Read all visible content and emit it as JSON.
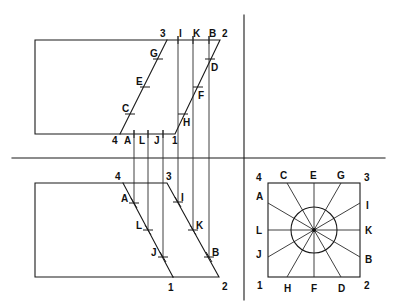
{
  "diagram": {
    "colors": {
      "line": "#1a1a1a",
      "background": "#ffffff"
    },
    "dividers": {
      "horizontal": {
        "x1": 12,
        "y1": 158,
        "x2": 385,
        "y2": 158
      },
      "vertical": {
        "x1": 244,
        "y1": 15,
        "x2": 244,
        "y2": 300
      }
    },
    "top_view": {
      "outline": [
        [
          35,
          40
        ],
        [
          220,
          40
        ],
        [
          175,
          134
        ],
        [
          35,
          134
        ]
      ],
      "slant_left": [
        [
          167,
          40
        ],
        [
          120,
          134
        ]
      ],
      "corners": [
        {
          "label": "3",
          "x": 160,
          "y": 37
        },
        {
          "label": "2",
          "x": 222,
          "y": 37
        },
        {
          "label": "4",
          "x": 112,
          "y": 144
        },
        {
          "label": "1",
          "x": 172,
          "y": 144
        }
      ],
      "top_labels": [
        {
          "label": "I",
          "x": 179,
          "y": 37
        },
        {
          "label": "K",
          "x": 193,
          "y": 37
        },
        {
          "label": "B",
          "x": 209,
          "y": 37
        }
      ],
      "bottom_labels": [
        {
          "label": "A",
          "x": 124,
          "y": 144
        },
        {
          "label": "L",
          "x": 139,
          "y": 144
        },
        {
          "label": "J",
          "x": 154,
          "y": 144
        }
      ],
      "left_points": [
        {
          "label": "G",
          "x": 158,
          "y": 59,
          "lx": 150,
          "ly": 57
        },
        {
          "label": "E",
          "x": 145,
          "y": 87,
          "lx": 136,
          "ly": 85
        },
        {
          "label": "C",
          "x": 130,
          "y": 114,
          "lx": 122,
          "ly": 112
        }
      ],
      "right_points": [
        {
          "label": "D",
          "x": 210,
          "y": 59,
          "lx": 211,
          "ly": 71
        },
        {
          "label": "F",
          "x": 198,
          "y": 87,
          "lx": 198,
          "ly": 99
        },
        {
          "label": "H",
          "x": 183,
          "y": 114,
          "lx": 183,
          "ly": 126
        }
      ]
    },
    "projectors": [
      {
        "x": 134,
        "y1": 130,
        "y2": 203
      },
      {
        "x": 148,
        "y1": 130,
        "y2": 230
      },
      {
        "x": 163,
        "y1": 130,
        "y2": 257
      },
      {
        "x": 178,
        "y1": 36,
        "y2": 202
      },
      {
        "x": 193,
        "y1": 36,
        "y2": 230
      },
      {
        "x": 209,
        "y1": 36,
        "y2": 257
      }
    ],
    "bottom_view": {
      "outline": [
        [
          123,
          183
        ],
        [
          35,
          183
        ],
        [
          35,
          277
        ],
        [
          219,
          277
        ],
        [
          167,
          183
        ],
        [
          123,
          183
        ]
      ],
      "slant_left": [
        [
          123,
          183
        ],
        [
          173,
          277
        ]
      ],
      "corners": [
        {
          "label": "4",
          "x": 115,
          "y": 180
        },
        {
          "label": "3",
          "x": 166,
          "y": 180
        },
        {
          "label": "1",
          "x": 168,
          "y": 291
        },
        {
          "label": "2",
          "x": 222,
          "y": 290
        }
      ],
      "left_points": [
        {
          "label": "A",
          "x": 134,
          "y": 203,
          "lx": 121,
          "ly": 202
        },
        {
          "label": "L",
          "x": 148,
          "y": 230,
          "lx": 136,
          "ly": 229
        },
        {
          "label": "J",
          "x": 163,
          "y": 257,
          "lx": 151,
          "ly": 256
        }
      ],
      "right_points": [
        {
          "label": "I",
          "x": 178,
          "y": 202,
          "lx": 181,
          "ly": 201
        },
        {
          "label": "K",
          "x": 193,
          "y": 230,
          "lx": 196,
          "ly": 229
        },
        {
          "label": "B",
          "x": 209,
          "y": 257,
          "lx": 212,
          "ly": 256
        }
      ]
    },
    "end_view": {
      "square": {
        "x": 268,
        "y": 183,
        "w": 92,
        "h": 94
      },
      "center": {
        "x": 314,
        "y": 230
      },
      "circle_r": 23,
      "rays": [
        {
          "from": "C",
          "to": "D",
          "x1": 287,
          "y1": 183,
          "x2": 341,
          "y2": 277
        },
        {
          "from": "E",
          "to": "F",
          "x1": 314,
          "y1": 183,
          "x2": 314,
          "y2": 277
        },
        {
          "from": "G",
          "to": "H",
          "x1": 341,
          "y1": 183,
          "x2": 287,
          "y2": 277
        },
        {
          "from": "A",
          "to": "B",
          "x1": 268,
          "y1": 203,
          "x2": 360,
          "y2": 257
        },
        {
          "from": "L",
          "to": "K",
          "x1": 268,
          "y1": 230,
          "x2": 360,
          "y2": 230
        },
        {
          "from": "J",
          "to": "I",
          "x1": 268,
          "y1": 257,
          "x2": 360,
          "y2": 203
        }
      ],
      "labels": [
        {
          "label": "4",
          "x": 256,
          "y": 181
        },
        {
          "label": "C",
          "x": 280,
          "y": 179
        },
        {
          "label": "E",
          "x": 310,
          "y": 179
        },
        {
          "label": "G",
          "x": 337,
          "y": 179
        },
        {
          "label": "3",
          "x": 364,
          "y": 181
        },
        {
          "label": "A",
          "x": 256,
          "y": 200
        },
        {
          "label": "I",
          "x": 366,
          "y": 209
        },
        {
          "label": "L",
          "x": 256,
          "y": 234
        },
        {
          "label": "K",
          "x": 365,
          "y": 234
        },
        {
          "label": "J",
          "x": 256,
          "y": 258
        },
        {
          "label": "B",
          "x": 365,
          "y": 263
        },
        {
          "label": "1",
          "x": 257,
          "y": 289
        },
        {
          "label": "H",
          "x": 284,
          "y": 292
        },
        {
          "label": "F",
          "x": 311,
          "y": 292
        },
        {
          "label": "D",
          "x": 338,
          "y": 292
        },
        {
          "label": "2",
          "x": 364,
          "y": 289
        }
      ]
    }
  }
}
